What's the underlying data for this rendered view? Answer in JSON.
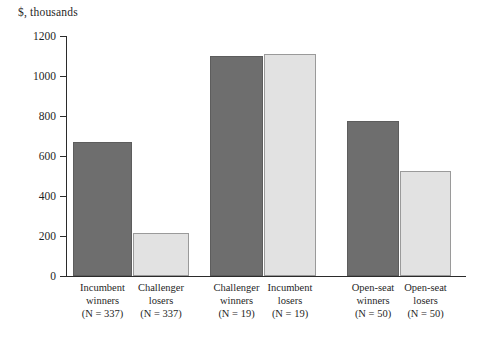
{
  "chart_data": {
    "type": "bar",
    "title": "$, thousands",
    "xlabel": "",
    "ylabel": "$, thousands",
    "ylim": [
      0,
      1200
    ],
    "ytick_values": [
      0,
      200,
      400,
      600,
      800,
      1000,
      1200
    ],
    "ytick_labels": [
      "0",
      "200",
      "400",
      "600",
      "800",
      "1000",
      "1200"
    ],
    "grid": false,
    "legend": "none",
    "categories": [
      "Incumbent winners (N = 337)",
      "Challenger losers (N = 337)",
      "Challenger winners (N = 19)",
      "Incumbent losers (N = 19)",
      "Open-seat winners (N = 50)",
      "Open-seat losers (N = 50)"
    ],
    "values": [
      670,
      215,
      1100,
      1110,
      775,
      525
    ],
    "bars": [
      {
        "line1": "Incumbent",
        "line2": "winners",
        "line3": "(N = 337)",
        "value": 670,
        "n": 337,
        "style": "dark",
        "group": 1
      },
      {
        "line1": "Challenger",
        "line2": "losers",
        "line3": "(N = 337)",
        "value": 215,
        "n": 337,
        "style": "light",
        "group": 1
      },
      {
        "line1": "Challenger",
        "line2": "winners",
        "line3": "(N = 19)",
        "value": 1100,
        "n": 19,
        "style": "dark",
        "group": 2
      },
      {
        "line1": "Incumbent",
        "line2": "losers",
        "line3": "(N = 19)",
        "value": 1110,
        "n": 19,
        "style": "light",
        "group": 2
      },
      {
        "line1": "Open-seat",
        "line2": "winners",
        "line3": "(N = 50)",
        "value": 775,
        "n": 50,
        "style": "dark",
        "group": 3
      },
      {
        "line1": "Open-seat",
        "line2": "losers",
        "line3": "(N = 50)",
        "value": 525,
        "n": 50,
        "style": "light",
        "group": 3
      }
    ],
    "colors": {
      "dark_bar": "#6e6e6e",
      "dark_bar_border": "#5d5d5d",
      "light_bar": "#e2e2e2",
      "light_bar_border": "#9a9a9a",
      "axis": "#2b2b2b",
      "text": "#1f1f1f",
      "background": "#ffffff"
    }
  }
}
